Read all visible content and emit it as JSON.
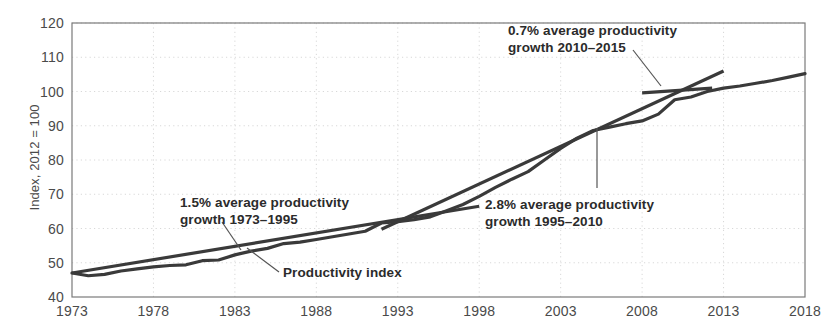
{
  "chart_data": {
    "type": "line",
    "title": "",
    "xlabel": "",
    "ylabel": "Index, 2012 = 100",
    "xlim": [
      1973,
      2018
    ],
    "ylim": [
      40,
      120
    ],
    "grid": true,
    "legend_position": "none",
    "y_ticks": [
      "40",
      "50",
      "60",
      "70",
      "80",
      "90",
      "100",
      "110",
      "120"
    ],
    "x_ticks": [
      "1973",
      "1978",
      "1983",
      "1988",
      "1993",
      "1998",
      "2003",
      "2008",
      "2013",
      "2018"
    ],
    "series": [
      {
        "name": "Productivity index",
        "x": [
          1973,
          1974,
          1975,
          1976,
          1977,
          1978,
          1979,
          1980,
          1981,
          1982,
          1983,
          1984,
          1985,
          1986,
          1987,
          1988,
          1989,
          1990,
          1991,
          1992,
          1993,
          1994,
          1995,
          1996,
          1997,
          1998,
          1999,
          2000,
          2001,
          2002,
          2003,
          2004,
          2005,
          2006,
          2007,
          2008,
          2009,
          2010,
          2011,
          2012,
          2013,
          2014,
          2015,
          2016,
          2017,
          2018
        ],
        "values": [
          47.0,
          46.2,
          46.6,
          47.6,
          48.2,
          48.8,
          49.2,
          49.4,
          50.6,
          50.8,
          52.3,
          53.4,
          54.2,
          55.6,
          56.0,
          56.8,
          57.6,
          58.4,
          59.2,
          61.6,
          62.0,
          62.6,
          63.4,
          65.2,
          67.0,
          69.4,
          72.0,
          74.4,
          76.6,
          80.0,
          83.4,
          86.4,
          88.6,
          89.6,
          90.6,
          91.4,
          93.4,
          97.6,
          98.4,
          100.0,
          101.0,
          101.6,
          102.4,
          103.2,
          104.2,
          105.2
        ]
      }
    ],
    "trend_lines": [
      {
        "name": "1.5% average productivity growth 1973-1995",
        "rate_pct": 1.5,
        "period": "1973–1995",
        "x_start": 1973,
        "x_end": 1998,
        "y_start": 47.0,
        "y_end": 66.5
      },
      {
        "name": "2.8% average productivity growth 1995-2010",
        "rate_pct": 2.8,
        "period": "1995–2010",
        "x_start": 1992,
        "x_end": 2013,
        "y_start": 59.8,
        "y_end": 106.0
      },
      {
        "name": "0.7% average productivity growth 2010-2015",
        "rate_pct": 0.7,
        "period": "2010–2015",
        "x_start": 2008,
        "x_end": 2012.3,
        "y_start": 99.6,
        "y_end": 101.0
      }
    ],
    "annotations": [
      {
        "id": "annot-15",
        "line1": "1.5% average productivity",
        "line2": "growth 1973–1995"
      },
      {
        "id": "annot-28",
        "line1": "2.8% average productivity",
        "line2": "growth 1995–2010"
      },
      {
        "id": "annot-07",
        "line1": "0.7% average productivity",
        "line2": "growth 2010–2015"
      },
      {
        "id": "annot-index",
        "line1": "Productivity index",
        "line2": ""
      }
    ],
    "colors": {
      "line": "#3a3a3a",
      "trend": "#3a3a3a",
      "grid": "#d8d8d8",
      "axis": "#6b6b6b",
      "text": "#3c3c3c",
      "background": "#ffffff"
    }
  }
}
